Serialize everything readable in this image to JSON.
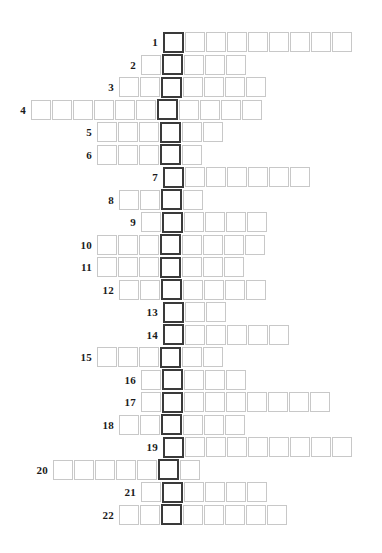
{
  "puzzle": {
    "type": "acrostic-grid",
    "total_rows": 22,
    "key_column_label": "key-column",
    "key_column_index_note": "one highlighted cell per row, vertically aligned",
    "colors": {
      "cell_border": "#c8c8c8",
      "key_cell_border": "#3a3a3a",
      "cell_fill": "#ffffff",
      "number_text": "#1a1a1a",
      "page_background": "#ffffff"
    },
    "rows": [
      {
        "number": "1",
        "cells_before_key": 0,
        "cells_after_key": 8,
        "total_cells": 9
      },
      {
        "number": "2",
        "cells_before_key": 1,
        "cells_after_key": 3,
        "total_cells": 5
      },
      {
        "number": "3",
        "cells_before_key": 2,
        "cells_after_key": 4,
        "total_cells": 7
      },
      {
        "number": "4",
        "cells_before_key": 6,
        "cells_after_key": 4,
        "total_cells": 11
      },
      {
        "number": "5",
        "cells_before_key": 3,
        "cells_after_key": 2,
        "total_cells": 6
      },
      {
        "number": "6",
        "cells_before_key": 3,
        "cells_after_key": 1,
        "total_cells": 5
      },
      {
        "number": "7",
        "cells_before_key": 0,
        "cells_after_key": 6,
        "total_cells": 7
      },
      {
        "number": "8",
        "cells_before_key": 2,
        "cells_after_key": 1,
        "total_cells": 4
      },
      {
        "number": "9",
        "cells_before_key": 1,
        "cells_after_key": 4,
        "total_cells": 6
      },
      {
        "number": "10",
        "cells_before_key": 3,
        "cells_after_key": 4,
        "total_cells": 8
      },
      {
        "number": "11",
        "cells_before_key": 3,
        "cells_after_key": 3,
        "total_cells": 7
      },
      {
        "number": "12",
        "cells_before_key": 2,
        "cells_after_key": 4,
        "total_cells": 7
      },
      {
        "number": "13",
        "cells_before_key": 0,
        "cells_after_key": 2,
        "total_cells": 3
      },
      {
        "number": "14",
        "cells_before_key": 0,
        "cells_after_key": 5,
        "total_cells": 6
      },
      {
        "number": "15",
        "cells_before_key": 3,
        "cells_after_key": 2,
        "total_cells": 6
      },
      {
        "number": "16",
        "cells_before_key": 1,
        "cells_after_key": 3,
        "total_cells": 5
      },
      {
        "number": "17",
        "cells_before_key": 1,
        "cells_after_key": 7,
        "total_cells": 9
      },
      {
        "number": "18",
        "cells_before_key": 2,
        "cells_after_key": 3,
        "total_cells": 6
      },
      {
        "number": "19",
        "cells_before_key": 0,
        "cells_after_key": 8,
        "total_cells": 9
      },
      {
        "number": "20",
        "cells_before_key": 5,
        "cells_after_key": 1,
        "total_cells": 7
      },
      {
        "number": "21",
        "cells_before_key": 1,
        "cells_after_key": 4,
        "total_cells": 6
      },
      {
        "number": "22",
        "cells_before_key": 2,
        "cells_after_key": 5,
        "total_cells": 8
      }
    ]
  },
  "metrics": {
    "cell_size": 22,
    "row_pitch": 22.5,
    "key_column_x": 163,
    "first_row_y": 31,
    "number_gutter": 26
  }
}
